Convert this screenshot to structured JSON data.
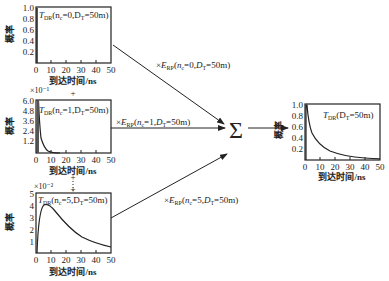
{
  "figure": {
    "plots": [
      {
        "id": "tdr-n0",
        "label": "T_DR(n_c=0,D_T=50m)",
        "label_parts": {
          "T": "T",
          "sub": "DR",
          "args": "(n",
          "nsub": "c",
          "rest": "=0,D",
          "dsub": "T",
          "tail": "=50m)"
        },
        "y_scale": "",
        "y_ticks": [
          "1.0",
          "0.8",
          "0.6",
          "0.4",
          "0.2"
        ],
        "x_ticks": [
          "0",
          "10",
          "20",
          "30",
          "40",
          "50"
        ],
        "ylabel": "概率",
        "xlabel": "到达时间/ns"
      },
      {
        "id": "tdr-n1",
        "label": "T_DR(n_c=1,D_T=50m)",
        "label_parts": {
          "T": "T",
          "sub": "DR",
          "args": "(n",
          "nsub": "c",
          "rest": "=1,D",
          "dsub": "T",
          "tail": "=50m)"
        },
        "y_scale": "×10⁻¹",
        "y_ticks": [
          "6.0",
          "4.8",
          "3.6",
          "2.4",
          "1.2"
        ],
        "x_ticks": [
          "0",
          "10",
          "20",
          "30",
          "40",
          "50"
        ],
        "ylabel": "概率",
        "xlabel": "到达时间/ns"
      },
      {
        "id": "tdr-n5",
        "label": "T_DR(n_c=5,D_T=50m)",
        "label_parts": {
          "T": "T",
          "sub": "DR",
          "args": "(n",
          "nsub": "c",
          "rest": "=5,D",
          "dsub": "T",
          "tail": "=50m)"
        },
        "y_scale": "×10⁻²",
        "y_ticks": [
          "5",
          "4",
          "3",
          "2",
          "1"
        ],
        "x_ticks": [
          "0",
          "10",
          "20",
          "30",
          "40",
          "50"
        ],
        "ylabel": "概率",
        "xlabel": "到达时间/ns"
      },
      {
        "id": "tdr-total",
        "label": "T_DR(D_T=50m)",
        "label_parts": {
          "T": "T",
          "sub": "DR",
          "args": "(D",
          "dsub": "T",
          "tail": "=50m)"
        },
        "y_scale": "",
        "y_ticks": [
          "1.0",
          "0.8",
          "0.6",
          "0.4",
          "0.2"
        ],
        "x_ticks": [
          "0",
          "10",
          "20",
          "30",
          "40",
          "50"
        ],
        "ylabel": "概率",
        "xlabel": "到达时间/ns"
      }
    ],
    "arrows": [
      {
        "label": "×E_RP(n_c=0,D_T=50m)",
        "parts": {
          "pre": "×E",
          "sub": "RP",
          "args": "(n",
          "nsub": "c",
          "rest": "=0,D",
          "dsub": "T",
          "tail": "=50m)"
        }
      },
      {
        "label": "×E_RP(n_c=1,D_T=50m)",
        "parts": {
          "pre": "×E",
          "sub": "RP",
          "args": "(n",
          "nsub": "c",
          "rest": "=1,D",
          "dsub": "T",
          "tail": "=50m)"
        }
      },
      {
        "label": "×E_RP(n_c=5,D_T=50m)",
        "parts": {
          "pre": "×E",
          "sub": "RP",
          "args": "(n",
          "nsub": "c",
          "rest": "=5,D",
          "dsub": "T",
          "tail": "=50m)"
        }
      }
    ],
    "sum_symbol": "Σ",
    "plus_symbol": "+",
    "colors": {
      "line": "#222222",
      "background": "#ffffff"
    }
  }
}
